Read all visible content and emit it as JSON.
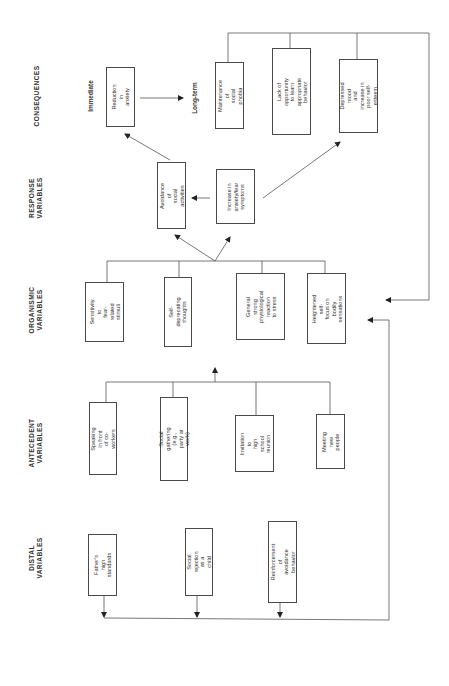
{
  "columns": {
    "consequences": "CONSEQUENCES",
    "response": "RESPONSE\nVARIABLES",
    "organismic": "ORGANISMIC\nVARIABLES",
    "antecedent": "ANTECEDENT\nVARIABLES",
    "distal": "DISTAL\nVARIABLES"
  },
  "consequences": {
    "immediate_label": "Immediate",
    "longterm_label": "Long-term",
    "immediate": "Reduction in\nanxiety",
    "longterm": [
      "Maintenance of\nsocial phobia",
      "Lack of opportunity\nto learn appropriate\nbehavior",
      "Depressed mood\nand increase in\npoor self-esteem"
    ]
  },
  "response": [
    "Avoidance of\nsocial activities",
    "Increase in\nanxiety/fear\nsymptoms"
  ],
  "organismic": [
    "Sensitivity to\nfear-related\nstimuli",
    "Self-deprecating\nthoughts",
    "General strong\nphysiological\nreaction\nto stress",
    "Heightened self-\nfocus on bodily\nsensations"
  ],
  "antecedent": [
    "Speaking in front\nof co-workers",
    "Social gathering\n(e.g., party at work)",
    "Invitation to\nhigh school\nreunion",
    "Meeting\nnew people"
  ],
  "distal": [
    "Father's high\nstandards",
    "Social rejection\nas a child",
    "Reinforcement of\navoidance behavior"
  ]
}
